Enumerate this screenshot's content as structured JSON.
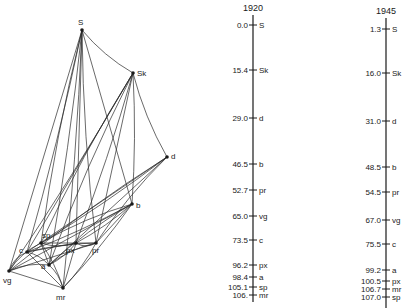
{
  "network": {
    "nodes": [
      {
        "id": "S",
        "label": "S",
        "x": 82,
        "y": 30,
        "lx": 78,
        "ly": 25,
        "anchor": "start"
      },
      {
        "id": "Sk",
        "label": "Sk",
        "x": 133,
        "y": 73,
        "lx": 137,
        "ly": 76,
        "anchor": "start"
      },
      {
        "id": "d",
        "label": "d",
        "x": 167,
        "y": 157,
        "lx": 171,
        "ly": 159,
        "anchor": "start"
      },
      {
        "id": "b",
        "label": "b",
        "x": 132,
        "y": 204,
        "lx": 136,
        "ly": 208,
        "anchor": "start"
      },
      {
        "id": "sp",
        "label": "sp",
        "x": 41,
        "y": 243,
        "lx": 42,
        "ly": 238,
        "anchor": "start"
      },
      {
        "id": "c",
        "label": "c",
        "x": 27,
        "y": 252,
        "lx": 19,
        "ly": 253,
        "anchor": "start"
      },
      {
        "id": "px",
        "label": "px",
        "x": 76,
        "y": 243,
        "lx": 66,
        "ly": 253,
        "anchor": "start"
      },
      {
        "id": "pr",
        "label": "pr",
        "x": 96,
        "y": 243,
        "lx": 92,
        "ly": 253,
        "anchor": "start"
      },
      {
        "id": "a",
        "label": "a",
        "x": 49,
        "y": 265,
        "lx": 41,
        "ly": 269,
        "anchor": "start"
      },
      {
        "id": "vg",
        "label": "vg",
        "x": 9,
        "y": 271,
        "lx": 3,
        "ly": 283,
        "anchor": "start"
      },
      {
        "id": "mr",
        "label": "mr",
        "x": 63,
        "y": 288,
        "lx": 56,
        "ly": 300,
        "anchor": "start"
      }
    ],
    "edges": [
      [
        "S",
        "Sk"
      ],
      [
        "S",
        "c"
      ],
      [
        "S",
        "vg"
      ],
      [
        "S",
        "sp"
      ],
      [
        "S",
        "a"
      ],
      [
        "S",
        "px"
      ],
      [
        "S",
        "pr"
      ],
      [
        "S",
        "mr"
      ],
      [
        "S",
        "b"
      ],
      [
        "Sk",
        "d"
      ],
      [
        "Sk",
        "b"
      ],
      [
        "Sk",
        "c"
      ],
      [
        "Sk",
        "sp"
      ],
      [
        "Sk",
        "px"
      ],
      [
        "Sk",
        "pr"
      ],
      [
        "Sk",
        "a"
      ],
      [
        "Sk",
        "vg"
      ],
      [
        "d",
        "c"
      ],
      [
        "d",
        "vg"
      ],
      [
        "d",
        "sp"
      ],
      [
        "d",
        "a"
      ],
      [
        "d",
        "pr"
      ],
      [
        "b",
        "c"
      ],
      [
        "b",
        "vg"
      ],
      [
        "b",
        "sp"
      ],
      [
        "b",
        "px"
      ],
      [
        "b",
        "pr"
      ],
      [
        "b",
        "a"
      ],
      [
        "b",
        "mr"
      ],
      [
        "sp",
        "pr"
      ],
      [
        "sp",
        "px"
      ],
      [
        "sp",
        "mr"
      ],
      [
        "sp",
        "a"
      ],
      [
        "sp",
        "vg"
      ],
      [
        "c",
        "pr"
      ],
      [
        "c",
        "px"
      ],
      [
        "c",
        "vg"
      ],
      [
        "c",
        "a"
      ],
      [
        "c",
        "mr"
      ],
      [
        "px",
        "pr"
      ],
      [
        "px",
        "a"
      ],
      [
        "px",
        "mr"
      ],
      [
        "pr",
        "a"
      ],
      [
        "pr",
        "mr"
      ],
      [
        "pr",
        "vg"
      ],
      [
        "a",
        "vg"
      ],
      [
        "a",
        "mr"
      ],
      [
        "vg",
        "mr"
      ]
    ]
  },
  "axes": [
    {
      "year": "1920",
      "x": 253,
      "top": 15,
      "bottom": 302,
      "ticks": [
        {
          "value": "0.0",
          "label": "S",
          "y": 25
        },
        {
          "value": "15.4",
          "label": "Sk",
          "y": 70
        },
        {
          "value": "29.0",
          "label": "d",
          "y": 118
        },
        {
          "value": "46.5",
          "label": "b",
          "y": 164
        },
        {
          "value": "52.7",
          "label": "pr",
          "y": 190
        },
        {
          "value": "65.0",
          "label": "vg",
          "y": 216
        },
        {
          "value": "73.5",
          "label": "c",
          "y": 240
        },
        {
          "value": "96.2",
          "label": "px",
          "y": 265
        },
        {
          "value": "98.4",
          "label": "a",
          "y": 277
        },
        {
          "value": "105.1",
          "label": "sp",
          "y": 287
        },
        {
          "value": "106.",
          "label": "mr",
          "y": 295
        }
      ]
    },
    {
      "year": "1945",
      "x": 386,
      "top": 18,
      "bottom": 308,
      "ticks": [
        {
          "value": "1.3",
          "label": "S",
          "y": 29
        },
        {
          "value": "16.0",
          "label": "Sk",
          "y": 73
        },
        {
          "value": "31.0",
          "label": "d",
          "y": 121
        },
        {
          "value": "48.5",
          "label": "b",
          "y": 167
        },
        {
          "value": "54.5",
          "label": "pr",
          "y": 192
        },
        {
          "value": "67.0",
          "label": "vg",
          "y": 220
        },
        {
          "value": "75.5",
          "label": "c",
          "y": 244
        },
        {
          "value": "99.2",
          "label": "a",
          "y": 270
        },
        {
          "value": "100.5",
          "label": "px",
          "y": 281
        },
        {
          "value": "106.7",
          "label": "mr",
          "y": 289
        },
        {
          "value": "107.0",
          "label": "sp",
          "y": 297
        }
      ]
    }
  ]
}
